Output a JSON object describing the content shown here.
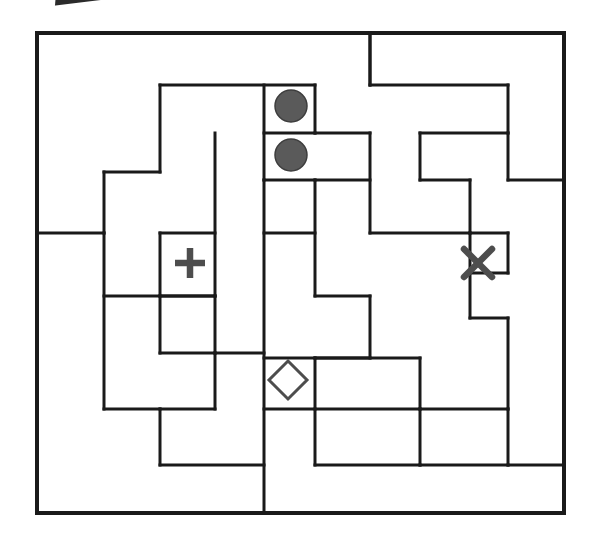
{
  "page": {
    "title": "Region-division puzzle grid",
    "background_color": "#ffffff",
    "line_color": "#1a1a1a",
    "symbol_color": "#4d4d4d",
    "circle_fill": "#5a5a5a",
    "width": 600,
    "height": 548
  },
  "grid": {
    "outer_border": {
      "x": 37,
      "y": 33,
      "width": 527,
      "height": 481
    },
    "columns_px": [
      37,
      104,
      160,
      215,
      264,
      315,
      370,
      420,
      470,
      508,
      564
    ],
    "rows_px": [
      33,
      85,
      133,
      180,
      233,
      273,
      318,
      358,
      396,
      435,
      470,
      513
    ],
    "stroke_width": 3,
    "outer_stroke_width": 4
  },
  "symbols": [
    {
      "name": "circle-top",
      "glyph": "filled-circle",
      "cx": 291,
      "cy": 106,
      "r": 16,
      "label": "●"
    },
    {
      "name": "circle-bottom",
      "glyph": "filled-circle",
      "cx": 291,
      "cy": 155,
      "r": 16,
      "label": "●"
    },
    {
      "name": "plus-mark",
      "glyph": "plus",
      "cx": 190,
      "cy": 263,
      "size": 30,
      "label": "+"
    },
    {
      "name": "cross-mark",
      "glyph": "cross",
      "cx": 478,
      "cy": 263,
      "size": 28,
      "label": "✕"
    },
    {
      "name": "diamond-mark",
      "glyph": "diamond",
      "cx": 288,
      "cy": 380,
      "size": 19,
      "label": "◇"
    }
  ],
  "segments": {
    "outer": [
      "M 37 33 L 564 33 L 564 513 L 37 513 Z"
    ],
    "horizontal": [
      "M 160 85 L 315 85",
      "M 370 33 L 370 85",
      "M 370 85 L 508 85",
      "M 104 172 L 160 172",
      "M 264 133 L 315 133",
      "M 315 133 L 370 133",
      "M 420 133 L 508 133",
      "M 264 180 L 315 180",
      "M 508 180 L 564 180",
      "M 37 233 L 104 233",
      "M 160 233 L 215 233",
      "M 315 180 L 370 180",
      "M 264 233 L 315 233",
      "M 420 180 L 470 180",
      "M 104 296 L 215 296",
      "M 160 296 L 215 296",
      "M 370 233 L 470 233",
      "M 470 233 L 508 233",
      "M 470 273 L 508 273",
      "M 315 296 L 370 296",
      "M 160 353 L 215 353",
      "M 215 353 L 264 353",
      "M 104 409 L 160 409",
      "M 160 409 L 215 409",
      "M 264 358 L 315 358",
      "M 315 358 L 370 358",
      "M 470 318 L 508 318",
      "M 315 358 L 420 358",
      "M 264 409 L 315 409",
      "M 315 409 L 420 409",
      "M 420 409 L 508 409",
      "M 160 465 L 264 465",
      "M 315 465 L 420 465",
      "M 420 465 L 508 465",
      "M 508 465 L 564 465"
    ],
    "vertical": [
      "M 160 85 L 160 172",
      "M 104 172 L 104 233",
      "M 264 85 L 264 180",
      "M 315 85 L 315 133",
      "M 215 133 L 215 296",
      "M 370 33 L 370 85",
      "M 508 85 L 508 133",
      "M 420 133 L 420 180",
      "M 264 180 L 264 513",
      "M 160 233 L 160 296",
      "M 315 180 L 315 296",
      "M 370 133 L 370 233",
      "M 470 180 L 470 233",
      "M 508 133 L 508 180",
      "M 104 233 L 104 409",
      "M 470 233 L 470 318",
      "M 508 233 L 508 273",
      "M 160 296 L 160 353",
      "M 215 296 L 215 353",
      "M 215 353 L 215 409",
      "M 370 296 L 370 358",
      "M 508 318 L 508 409",
      "M 315 358 L 315 465",
      "M 160 409 L 160 465",
      "M 420 358 L 420 409",
      "M 420 409 L 420 465",
      "M 508 409 L 508 465"
    ]
  }
}
